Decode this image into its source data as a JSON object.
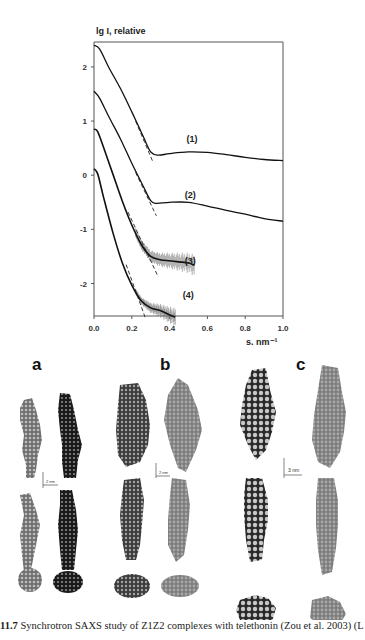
{
  "figure": {
    "caption_number": "11.7",
    "caption_text": "Synchrotron SAXS study of Z1Z2 complexes with telethonin (Zou et al. 2003) (L"
  },
  "chart_data": {
    "type": "line",
    "title": "",
    "xlabel": "s, nm⁻¹",
    "ylabel": "lg I, relative",
    "xlim": [
      0.0,
      1.0
    ],
    "ylim": [
      -2.6,
      2.46
    ],
    "xticks": [
      "0.0",
      "0.2",
      "0.4",
      "0.6",
      "0.8",
      "1.0"
    ],
    "yticks": [
      "2",
      "1",
      "0",
      "-1",
      "-2"
    ],
    "grid": false,
    "legend": "inline curve labels",
    "series": [
      {
        "name": "(1)",
        "x": [
          0.0,
          0.03,
          0.08,
          0.14,
          0.2,
          0.26,
          0.3,
          0.34,
          0.4,
          0.5,
          0.6,
          0.7,
          0.8,
          0.9,
          1.0
        ],
        "y": [
          2.4,
          2.33,
          1.98,
          1.6,
          1.17,
          0.72,
          0.43,
          0.37,
          0.4,
          0.43,
          0.42,
          0.38,
          0.33,
          0.29,
          0.27
        ]
      },
      {
        "name": "(2)",
        "x": [
          0.0,
          0.03,
          0.08,
          0.14,
          0.2,
          0.26,
          0.3,
          0.33,
          0.4,
          0.5,
          0.6,
          0.7,
          0.8,
          0.9,
          1.0
        ],
        "y": [
          1.55,
          1.42,
          1.07,
          0.67,
          0.22,
          -0.2,
          -0.47,
          -0.52,
          -0.5,
          -0.5,
          -0.57,
          -0.65,
          -0.72,
          -0.8,
          -0.85
        ]
      },
      {
        "name": "(3)",
        "x": [
          0.0,
          0.02,
          0.06,
          0.1,
          0.15,
          0.2,
          0.25,
          0.3,
          0.35,
          0.4,
          0.45,
          0.5,
          0.53
        ],
        "y": [
          0.85,
          0.8,
          0.42,
          0.02,
          -0.48,
          -0.92,
          -1.28,
          -1.5,
          -1.56,
          -1.58,
          -1.6,
          -1.62,
          -1.66
        ]
      },
      {
        "name": "(4)",
        "x": [
          0.0,
          0.02,
          0.05,
          0.1,
          0.15,
          0.2,
          0.25,
          0.3,
          0.35,
          0.4,
          0.43
        ],
        "y": [
          0.12,
          0.02,
          -0.4,
          -1.06,
          -1.62,
          -2.03,
          -2.32,
          -2.45,
          -2.5,
          -2.58,
          -2.62
        ]
      }
    ],
    "fit_lines": [
      {
        "name": "(1) Guinier fit",
        "x": [
          0.22,
          0.31
        ],
        "y": [
          1.0,
          0.26
        ]
      },
      {
        "name": "(2) Guinier fit",
        "x": [
          0.22,
          0.33
        ],
        "y": [
          0.05,
          -0.75
        ]
      },
      {
        "name": "(3) Guinier fit",
        "x": [
          0.18,
          0.34
        ],
        "y": [
          -0.68,
          -1.88
        ]
      },
      {
        "name": "(4) Guinier fit",
        "x": [
          0.17,
          0.27
        ],
        "y": [
          -1.65,
          -2.62
        ]
      }
    ],
    "annotations": [
      {
        "text": "(1)",
        "x": 0.49,
        "y": 0.61
      },
      {
        "text": "(2)",
        "x": 0.48,
        "y": -0.42
      },
      {
        "text": "(3)",
        "x": 0.48,
        "y": -1.64
      },
      {
        "text": "(4)",
        "x": 0.47,
        "y": -2.27
      }
    ]
  },
  "panels": [
    {
      "letter": "a",
      "scale_label": "2 nm"
    },
    {
      "letter": "b",
      "scale_label": "2 nm"
    },
    {
      "letter": "c",
      "scale_label": "3 nm"
    }
  ]
}
